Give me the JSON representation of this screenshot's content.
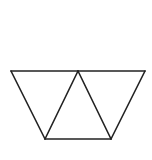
{
  "diagram": {
    "stroke_color": "#222222",
    "background_color": "#ffffff",
    "stroke_width": 1.6,
    "vertices": {
      "top_left": [
        11,
        71
      ],
      "top_middle": [
        78,
        71
      ],
      "top_right": [
        145,
        71
      ],
      "bottom_left": [
        45,
        139
      ],
      "bottom_right": [
        111,
        139
      ]
    },
    "triangles": [
      {
        "name": "left-triangle",
        "points": [
          "top_left",
          "top_middle",
          "bottom_left"
        ]
      },
      {
        "name": "center-triangle",
        "points": [
          "top_middle",
          "bottom_left",
          "bottom_right"
        ]
      },
      {
        "name": "right-triangle",
        "points": [
          "top_middle",
          "top_right",
          "bottom_right"
        ]
      }
    ]
  }
}
